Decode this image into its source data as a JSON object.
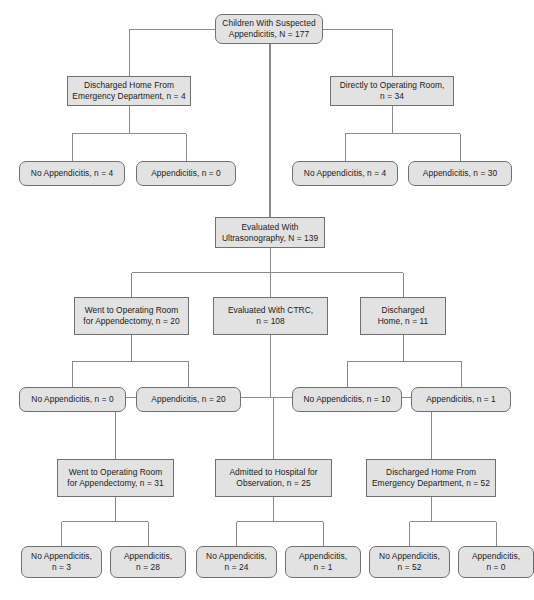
{
  "figure": {
    "type": "flowchart",
    "background_color": "#ffffff",
    "node_fill_color": "#e2e2e2",
    "node_border_color": "#707070",
    "connector_color": "#8a8a8a",
    "text_color": "#1a1a1a"
  },
  "nodes": [
    {
      "id": "root",
      "label": "Children With Suspected\nAppendicitis, N = 177",
      "shape": "rounded",
      "x": 215,
      "y": 14,
      "w": 108,
      "h": 30
    },
    {
      "id": "discharged-ed-1",
      "label": "Discharged Home From\nEmergency Department, n = 4",
      "shape": "square",
      "x": 67,
      "y": 76,
      "w": 124,
      "h": 30
    },
    {
      "id": "directly-or",
      "label": "Directly to Operating Room,\nn = 34",
      "shape": "square",
      "x": 330,
      "y": 76,
      "w": 124,
      "h": 30
    },
    {
      "id": "no-app-1",
      "label": "No Appendicitis, n = 4",
      "shape": "rounded",
      "x": 19,
      "y": 161,
      "w": 106,
      "h": 25
    },
    {
      "id": "app-1",
      "label": "Appendicitis, n = 0",
      "shape": "rounded",
      "x": 136,
      "y": 161,
      "w": 100,
      "h": 25
    },
    {
      "id": "no-app-2",
      "label": "No Appendicitis, n = 4",
      "shape": "rounded",
      "x": 292,
      "y": 161,
      "w": 106,
      "h": 25
    },
    {
      "id": "app-2",
      "label": "Appendicitis, n = 30",
      "shape": "rounded",
      "x": 408,
      "y": 161,
      "w": 104,
      "h": 25
    },
    {
      "id": "evaluated-us",
      "label": "Evaluated With\nUltrasonography, N = 139",
      "shape": "square",
      "x": 215,
      "y": 217,
      "w": 110,
      "h": 31
    },
    {
      "id": "or-appendectomy-20",
      "label": "Went to Operating Room\nfor Appendectomy, n = 20",
      "shape": "square",
      "x": 74,
      "y": 297,
      "w": 115,
      "h": 38
    },
    {
      "id": "evaluated-ctrc",
      "label": "Evaluated With CTRC,\nn = 108",
      "shape": "square",
      "x": 213,
      "y": 297,
      "w": 115,
      "h": 38
    },
    {
      "id": "discharged-home-11",
      "label": "Discharged\nHome, n = 11",
      "shape": "square",
      "x": 360,
      "y": 297,
      "w": 86,
      "h": 38
    },
    {
      "id": "no-app-3",
      "label": "No Appendicitis, n = 0",
      "shape": "rounded",
      "x": 19,
      "y": 387,
      "w": 107,
      "h": 25
    },
    {
      "id": "app-3",
      "label": "Appendicitis, n = 20",
      "shape": "rounded",
      "x": 136,
      "y": 387,
      "w": 105,
      "h": 25
    },
    {
      "id": "no-app-4",
      "label": "No Appendicitis, n = 10",
      "shape": "rounded",
      "x": 292,
      "y": 387,
      "w": 110,
      "h": 25
    },
    {
      "id": "app-4",
      "label": "Appendicitis, n = 1",
      "shape": "rounded",
      "x": 411,
      "y": 387,
      "w": 100,
      "h": 25
    },
    {
      "id": "or-appendectomy-31",
      "label": "Went to Operating Room\nfor Appendectomy, n = 31",
      "shape": "square",
      "x": 57,
      "y": 459,
      "w": 117,
      "h": 38
    },
    {
      "id": "admitted-observation",
      "label": "Admitted to Hospital for\nObservation, n = 25",
      "shape": "square",
      "x": 215,
      "y": 459,
      "w": 117,
      "h": 38
    },
    {
      "id": "discharged-ed-52",
      "label": "Discharged Home From\nEmergency Department, n = 52",
      "shape": "square",
      "x": 366,
      "y": 459,
      "w": 130,
      "h": 38
    },
    {
      "id": "no-app-5",
      "label": "No Appendicitis,\nn = 3",
      "shape": "rounded",
      "x": 21,
      "y": 546,
      "w": 81,
      "h": 32
    },
    {
      "id": "app-5",
      "label": "Appendicitis,\nn = 28",
      "shape": "rounded",
      "x": 110,
      "y": 546,
      "w": 76,
      "h": 32
    },
    {
      "id": "no-app-6",
      "label": "No Appendicitis,\nn = 24",
      "shape": "rounded",
      "x": 196,
      "y": 546,
      "w": 81,
      "h": 32
    },
    {
      "id": "app-6",
      "label": "Appendicitis,\nn = 1",
      "shape": "rounded",
      "x": 285,
      "y": 546,
      "w": 76,
      "h": 32
    },
    {
      "id": "no-app-7",
      "label": "No Appendicitis,\nn = 52",
      "shape": "rounded",
      "x": 369,
      "y": 546,
      "w": 81,
      "h": 32
    },
    {
      "id": "app-7",
      "label": "Appendicitis,\nn = 0",
      "shape": "rounded",
      "x": 458,
      "y": 546,
      "w": 76,
      "h": 32
    }
  ],
  "chart_data": {
    "type": "flowchart",
    "total_n": 177,
    "flow": [
      {
        "level": 0,
        "label": "Children With Suspected Appendicitis",
        "n": 177
      },
      {
        "level": 1,
        "label": "Discharged Home From Emergency Department",
        "n": 4,
        "outcomes": [
          {
            "label": "No Appendicitis",
            "n": 4
          },
          {
            "label": "Appendicitis",
            "n": 0
          }
        ]
      },
      {
        "level": 1,
        "label": "Directly to Operating Room",
        "n": 34,
        "outcomes": [
          {
            "label": "No Appendicitis",
            "n": 4
          },
          {
            "label": "Appendicitis",
            "n": 30
          }
        ]
      },
      {
        "level": 1,
        "label": "Evaluated With Ultrasonography",
        "n": 139
      },
      {
        "level": 2,
        "label": "Went to Operating Room for Appendectomy",
        "n": 20,
        "outcomes": [
          {
            "label": "No Appendicitis",
            "n": 0
          },
          {
            "label": "Appendicitis",
            "n": 20
          }
        ]
      },
      {
        "level": 2,
        "label": "Evaluated With CTRC",
        "n": 108
      },
      {
        "level": 2,
        "label": "Discharged Home",
        "n": 11,
        "outcomes": [
          {
            "label": "No Appendicitis",
            "n": 10
          },
          {
            "label": "Appendicitis",
            "n": 1
          }
        ]
      },
      {
        "level": 3,
        "label": "Went to Operating Room for Appendectomy",
        "n": 31,
        "outcomes": [
          {
            "label": "No Appendicitis",
            "n": 3
          },
          {
            "label": "Appendicitis",
            "n": 28
          }
        ]
      },
      {
        "level": 3,
        "label": "Admitted to Hospital for Observation",
        "n": 25,
        "outcomes": [
          {
            "label": "No Appendicitis",
            "n": 24
          },
          {
            "label": "Appendicitis",
            "n": 1
          }
        ]
      },
      {
        "level": 3,
        "label": "Discharged Home From Emergency Department",
        "n": 52,
        "outcomes": [
          {
            "label": "No Appendicitis",
            "n": 52
          },
          {
            "label": "Appendicitis",
            "n": 0
          }
        ]
      }
    ]
  },
  "connectors": [
    {
      "from": "root",
      "to": "discharged-ed-1"
    },
    {
      "from": "root",
      "to": "directly-or"
    },
    {
      "from": "root",
      "to": "evaluated-us"
    },
    {
      "from": "discharged-ed-1",
      "to": "no-app-1"
    },
    {
      "from": "discharged-ed-1",
      "to": "app-1"
    },
    {
      "from": "directly-or",
      "to": "no-app-2"
    },
    {
      "from": "directly-or",
      "to": "app-2"
    },
    {
      "from": "evaluated-us",
      "to": "or-appendectomy-20"
    },
    {
      "from": "evaluated-us",
      "to": "evaluated-ctrc"
    },
    {
      "from": "evaluated-us",
      "to": "discharged-home-11"
    },
    {
      "from": "or-appendectomy-20",
      "to": "no-app-3"
    },
    {
      "from": "or-appendectomy-20",
      "to": "app-3"
    },
    {
      "from": "discharged-home-11",
      "to": "no-app-4"
    },
    {
      "from": "discharged-home-11",
      "to": "app-4"
    },
    {
      "from": "evaluated-ctrc",
      "to": "or-appendectomy-31"
    },
    {
      "from": "evaluated-ctrc",
      "to": "admitted-observation"
    },
    {
      "from": "evaluated-ctrc",
      "to": "discharged-ed-52"
    },
    {
      "from": "or-appendectomy-31",
      "to": "no-app-5"
    },
    {
      "from": "or-appendectomy-31",
      "to": "app-5"
    },
    {
      "from": "admitted-observation",
      "to": "no-app-6"
    },
    {
      "from": "admitted-observation",
      "to": "app-6"
    },
    {
      "from": "discharged-ed-52",
      "to": "no-app-7"
    },
    {
      "from": "discharged-ed-52",
      "to": "app-7"
    }
  ]
}
